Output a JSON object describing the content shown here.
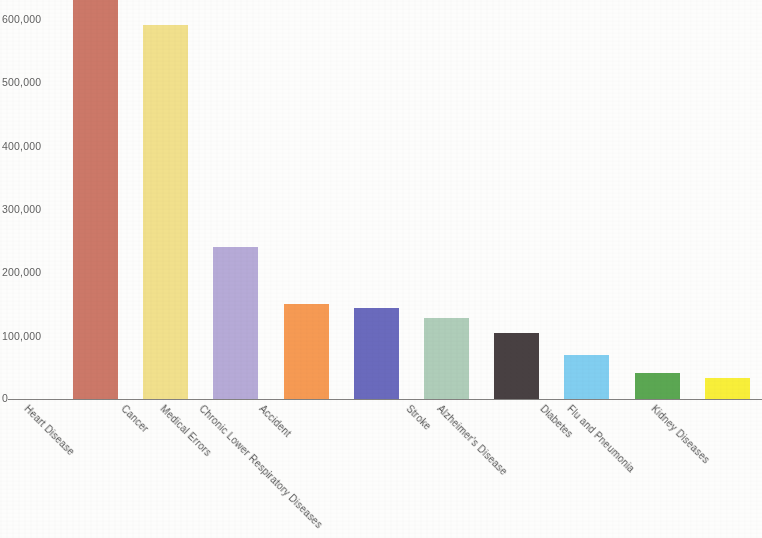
{
  "chart_data": {
    "type": "bar",
    "title": "",
    "subtitle": "",
    "xlabel": "",
    "ylabel": "",
    "categories": [
      "Heart Disease",
      "Cancer",
      "Medical Errors",
      "Accident",
      "Chronic Lower Respiratory Diseases",
      "Stroke",
      "Alzheimer's Disease",
      "Diabetes",
      "Flu and Pneumonia",
      "Kidney Diseases"
    ],
    "values": [
      630000,
      591000,
      240000,
      150000,
      144000,
      128000,
      104000,
      70000,
      41000,
      33000
    ],
    "ylim": [
      0,
      630000
    ],
    "yticks": [
      0,
      100000,
      200000,
      300000,
      400000,
      500000,
      600000
    ],
    "ytick_labels": [
      "0",
      "100,000",
      "200,000",
      "300,000",
      "400,000",
      "500,000",
      "600,000"
    ],
    "grid": false,
    "legend": "none",
    "bar_colors": [
      "#c86e5d",
      "#f0de83",
      "#b0a4d4",
      "#f59246",
      "#5f5fb8",
      "#a9c9b4",
      "#3a3234",
      "#77caef",
      "#4fa045",
      "#f7ee2a"
    ]
  },
  "axis": {
    "baseline_color": "#6c6a68",
    "tick_text_color": "#4a4a4a"
  }
}
